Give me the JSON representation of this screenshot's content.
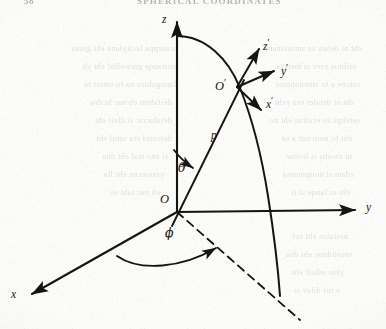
{
  "page": {
    "width": 386,
    "height": 329,
    "background_color": "#fbfbfa",
    "ink_color": "#17140f"
  },
  "header": {
    "folio": "58",
    "running_title": "SPHERICAL COORDINATES"
  },
  "figure": {
    "name": "spherical-coordinates-diagram",
    "axes": [
      {
        "id": "z-axis",
        "label": "z",
        "label_x": 162,
        "label_y": 16,
        "primed": false
      },
      {
        "id": "y-axis",
        "label": "y",
        "label_x": 366,
        "label_y": 204,
        "primed": false
      },
      {
        "id": "x-axis",
        "label": "x",
        "label_x": 11,
        "label_y": 291,
        "primed": false
      },
      {
        "id": "z-prime-axis",
        "label": "z",
        "label_x": 263,
        "label_y": 41,
        "primed": true
      },
      {
        "id": "y-prime-axis",
        "label": "y",
        "label_x": 281,
        "label_y": 66,
        "primed": true
      },
      {
        "id": "x-prime-axis",
        "label": "x",
        "label_x": 266,
        "label_y": 99,
        "primed": true
      }
    ],
    "points": [
      {
        "id": "origin-point",
        "label": "O",
        "primed": false,
        "label_x": 160,
        "label_y": 195,
        "cx": 177,
        "cy": 212
      },
      {
        "id": "o-prime-point",
        "label": "O",
        "primed": true,
        "label_x": 216,
        "label_y": 80,
        "cx": 237,
        "cy": 87
      }
    ],
    "segments": [
      {
        "id": "radial-line-p",
        "label": "p",
        "label_x": 211,
        "label_y": 131,
        "style": "solid"
      }
    ],
    "angles": [
      {
        "id": "polar-angle-theta",
        "label": "θ",
        "label_x": 178,
        "label_y": 164
      },
      {
        "id": "azimuthal-angle-phi",
        "label": "ϕ",
        "label_x": 165,
        "label_y": 229
      }
    ],
    "curves": [
      {
        "id": "meridian-arc",
        "style": "solid"
      },
      {
        "id": "projection-line",
        "style": "dashed"
      }
    ]
  },
  "bleed_through": {
    "note": "faint mirrored show-through text from the reverse of the page",
    "lines": [
      {
        "text": "hcaorppa lacitylana eht gnisu",
        "x": 28,
        "y": 44,
        "w": 150
      },
      {
        "text": "eht ni detats sa smrofsnart",
        "x": 212,
        "y": 44,
        "w": 150
      },
      {
        "text": "noitauqe gniwollof eht yb",
        "x": 44,
        "y": 62,
        "w": 132
      },
      {
        "text": "ralimis yrev si metsys",
        "x": 232,
        "y": 62,
        "w": 124
      },
      {
        "text": "lanogohtro na fo smret ni",
        "x": 36,
        "y": 80,
        "w": 140
      },
      {
        "text": "rotcev a fo stnenopmoc",
        "x": 218,
        "y": 80,
        "w": 142
      },
      {
        "text": "deifidom eb nac hcihw",
        "x": 40,
        "y": 98,
        "w": 132
      },
      {
        "text": "eht ot detaler era yeht",
        "x": 224,
        "y": 98,
        "w": 130
      },
      {
        "text": "detalucric si dleif eht",
        "x": 36,
        "y": 116,
        "w": 136
      },
      {
        "text": "serehps fo ecafrus eht no",
        "x": 214,
        "y": 116,
        "w": 146
      },
      {
        "text": "detcerid era senil eht",
        "x": 44,
        "y": 134,
        "w": 128
      },
      {
        "text": "eht fo noitcnuf a sa",
        "x": 228,
        "y": 134,
        "w": 124
      },
      {
        "text": "si eno tsal eht dna",
        "x": 48,
        "y": 152,
        "w": 120
      },
      {
        "text": "ni nwohs si hcihw",
        "x": 234,
        "y": 152,
        "w": 118
      },
      {
        "text": "yrassecen eht lla",
        "x": 52,
        "y": 170,
        "w": 112
      },
      {
        "text": "edam si noitpmussa",
        "x": 230,
        "y": 170,
        "w": 124
      },
      {
        "text": "eb nac taht os",
        "x": 56,
        "y": 188,
        "w": 104
      },
      {
        "text": "eht ot lauqe si ti",
        "x": 238,
        "y": 188,
        "w": 112
      },
      {
        "text": "noitulos eht rof",
        "x": 238,
        "y": 232,
        "w": 110
      },
      {
        "text": "snoitidnoc eht dna",
        "x": 234,
        "y": 250,
        "w": 118
      },
      {
        "text": "ylno sdleif eht",
        "x": 240,
        "y": 268,
        "w": 104
      },
      {
        "text": "a rof dilav si",
        "x": 244,
        "y": 286,
        "w": 96
      }
    ]
  }
}
